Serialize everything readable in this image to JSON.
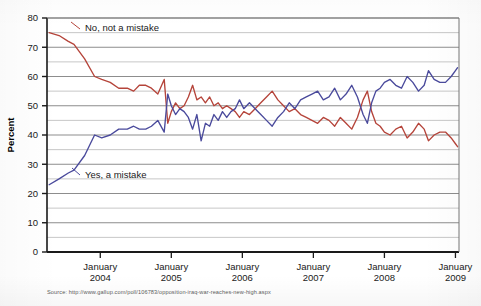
{
  "axes": {
    "ylabel": "Percent",
    "ylim": [
      0,
      80
    ],
    "yticks": [
      0,
      10,
      20,
      30,
      40,
      50,
      60,
      70,
      80
    ],
    "ytick_labels": [
      "0",
      "10",
      "20",
      "30",
      "40",
      "50",
      "60",
      "70",
      "80"
    ],
    "xtick_labels": [
      {
        "line1": "January",
        "line2": "2004"
      },
      {
        "line1": "January",
        "line2": "2005"
      },
      {
        "line1": "January",
        "line2": "2006"
      },
      {
        "line1": "January",
        "line2": "2007"
      },
      {
        "line1": "January",
        "line2": "2008"
      },
      {
        "line1": "January",
        "line2": "2009"
      }
    ]
  },
  "annotations": {
    "red_label": "No, not a mistake",
    "blue_label": "Yes, a mistake"
  },
  "source": {
    "text": "Source: http://www.gallup.com/poll/106783/opposition-iraq-war-reaches-new-high.aspx"
  },
  "colors": {
    "red": "#b5443a",
    "blue": "#4a4a9c",
    "gridline": "#8d8d8d",
    "axis": "#1a1a1a"
  },
  "chart_data": {
    "type": "line",
    "title": "",
    "xlabel": "",
    "ylabel": "Percent",
    "ylim": [
      0,
      80
    ],
    "xlim": [
      2003.25,
      2009.05
    ],
    "grid": true,
    "legend": "inline-annotations",
    "xtick_values": [
      2004.0,
      2005.0,
      2006.0,
      2007.0,
      2008.0,
      2009.0
    ],
    "xtick_text": [
      "January 2004",
      "January 2005",
      "January 2006",
      "January 2007",
      "January 2008",
      "January 2009"
    ],
    "series": [
      {
        "name": "No, not a mistake",
        "color": "#b5443a",
        "points": [
          [
            2003.28,
            75
          ],
          [
            2003.42,
            74
          ],
          [
            2003.55,
            72
          ],
          [
            2003.63,
            71
          ],
          [
            2003.78,
            66
          ],
          [
            2003.92,
            60
          ],
          [
            2004.02,
            59
          ],
          [
            2004.14,
            58
          ],
          [
            2004.26,
            56
          ],
          [
            2004.38,
            56
          ],
          [
            2004.47,
            55
          ],
          [
            2004.55,
            57
          ],
          [
            2004.64,
            57
          ],
          [
            2004.72,
            56
          ],
          [
            2004.81,
            54
          ],
          [
            2004.9,
            59
          ],
          [
            2004.95,
            44
          ],
          [
            2005.0,
            48
          ],
          [
            2005.06,
            51
          ],
          [
            2005.12,
            49
          ],
          [
            2005.18,
            50
          ],
          [
            2005.24,
            53
          ],
          [
            2005.3,
            57
          ],
          [
            2005.36,
            52
          ],
          [
            2005.42,
            53
          ],
          [
            2005.48,
            51
          ],
          [
            2005.54,
            53
          ],
          [
            2005.6,
            50
          ],
          [
            2005.66,
            51
          ],
          [
            2005.72,
            49
          ],
          [
            2005.78,
            50
          ],
          [
            2005.84,
            49
          ],
          [
            2005.9,
            48
          ],
          [
            2005.96,
            46
          ],
          [
            2006.02,
            48
          ],
          [
            2006.1,
            47
          ],
          [
            2006.18,
            49
          ],
          [
            2006.26,
            51
          ],
          [
            2006.34,
            53
          ],
          [
            2006.42,
            55
          ],
          [
            2006.5,
            52
          ],
          [
            2006.58,
            50
          ],
          [
            2006.66,
            48
          ],
          [
            2006.74,
            49
          ],
          [
            2006.82,
            47
          ],
          [
            2006.9,
            46
          ],
          [
            2006.98,
            45
          ],
          [
            2007.06,
            44
          ],
          [
            2007.14,
            46
          ],
          [
            2007.22,
            45
          ],
          [
            2007.3,
            43
          ],
          [
            2007.38,
            46
          ],
          [
            2007.46,
            44
          ],
          [
            2007.54,
            42
          ],
          [
            2007.62,
            46
          ],
          [
            2007.7,
            52
          ],
          [
            2007.76,
            55
          ],
          [
            2007.82,
            48
          ],
          [
            2007.88,
            44
          ],
          [
            2007.94,
            43
          ],
          [
            2008.0,
            41
          ],
          [
            2008.08,
            40
          ],
          [
            2008.16,
            42
          ],
          [
            2008.24,
            43
          ],
          [
            2008.32,
            39
          ],
          [
            2008.4,
            41
          ],
          [
            2008.48,
            44
          ],
          [
            2008.56,
            42
          ],
          [
            2008.62,
            38
          ],
          [
            2008.7,
            40
          ],
          [
            2008.78,
            41
          ],
          [
            2008.86,
            41
          ],
          [
            2008.94,
            39
          ],
          [
            2009.0,
            37
          ],
          [
            2009.03,
            36
          ]
        ]
      },
      {
        "name": "Yes, a mistake",
        "color": "#4a4a9c",
        "points": [
          [
            2003.28,
            23
          ],
          [
            2003.42,
            25
          ],
          [
            2003.55,
            27
          ],
          [
            2003.63,
            28
          ],
          [
            2003.78,
            33
          ],
          [
            2003.92,
            40
          ],
          [
            2004.02,
            39
          ],
          [
            2004.14,
            40
          ],
          [
            2004.26,
            42
          ],
          [
            2004.38,
            42
          ],
          [
            2004.47,
            43
          ],
          [
            2004.55,
            42
          ],
          [
            2004.64,
            42
          ],
          [
            2004.72,
            43
          ],
          [
            2004.81,
            45
          ],
          [
            2004.9,
            41
          ],
          [
            2004.95,
            54
          ],
          [
            2005.0,
            50
          ],
          [
            2005.06,
            47
          ],
          [
            2005.12,
            49
          ],
          [
            2005.18,
            48
          ],
          [
            2005.24,
            46
          ],
          [
            2005.3,
            42
          ],
          [
            2005.36,
            47
          ],
          [
            2005.42,
            38
          ],
          [
            2005.48,
            44
          ],
          [
            2005.54,
            43
          ],
          [
            2005.6,
            47
          ],
          [
            2005.66,
            45
          ],
          [
            2005.72,
            48
          ],
          [
            2005.78,
            46
          ],
          [
            2005.84,
            48
          ],
          [
            2005.9,
            49
          ],
          [
            2005.96,
            52
          ],
          [
            2006.02,
            49
          ],
          [
            2006.1,
            51
          ],
          [
            2006.18,
            49
          ],
          [
            2006.26,
            47
          ],
          [
            2006.34,
            45
          ],
          [
            2006.42,
            43
          ],
          [
            2006.5,
            46
          ],
          [
            2006.58,
            48
          ],
          [
            2006.66,
            51
          ],
          [
            2006.74,
            49
          ],
          [
            2006.82,
            52
          ],
          [
            2006.9,
            53
          ],
          [
            2006.98,
            54
          ],
          [
            2007.06,
            55
          ],
          [
            2007.14,
            52
          ],
          [
            2007.22,
            53
          ],
          [
            2007.3,
            56
          ],
          [
            2007.38,
            52
          ],
          [
            2007.46,
            54
          ],
          [
            2007.54,
            57
          ],
          [
            2007.62,
            53
          ],
          [
            2007.7,
            47
          ],
          [
            2007.76,
            44
          ],
          [
            2007.82,
            51
          ],
          [
            2007.88,
            55
          ],
          [
            2007.94,
            56
          ],
          [
            2008.0,
            58
          ],
          [
            2008.08,
            59
          ],
          [
            2008.16,
            57
          ],
          [
            2008.24,
            56
          ],
          [
            2008.32,
            60
          ],
          [
            2008.4,
            58
          ],
          [
            2008.48,
            55
          ],
          [
            2008.56,
            57
          ],
          [
            2008.62,
            62
          ],
          [
            2008.7,
            59
          ],
          [
            2008.78,
            58
          ],
          [
            2008.86,
            58
          ],
          [
            2008.94,
            60
          ],
          [
            2009.0,
            62
          ],
          [
            2009.03,
            63
          ]
        ]
      }
    ]
  }
}
